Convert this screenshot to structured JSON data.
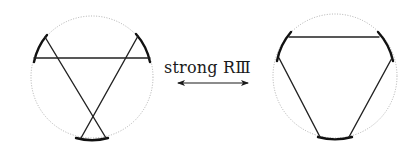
{
  "figure": {
    "move_label": "strong RⅢ",
    "arrow": "double-headed",
    "colors": {
      "background": "#ffffff",
      "boundary_circle": "#9a9a9a",
      "strands": "#222222",
      "arcs": "#111111"
    },
    "left_diagram": {
      "name": "before-move",
      "circle": {
        "cx": 92,
        "cy": 77,
        "r": 61
      },
      "arcs": [
        {
          "d": "M 34 62 A 61 61 0 0 1 47 35"
        },
        {
          "d": "M 136 34 A 61 61 0 0 1 150 62"
        },
        {
          "d": "M 76 138 A 61 61 0 0 0 108 138"
        }
      ],
      "strands": [
        {
          "x1": 34,
          "y1": 58,
          "x2": 150,
          "y2": 58
        },
        {
          "x1": 45,
          "y1": 37,
          "x2": 106,
          "y2": 138
        },
        {
          "x1": 138,
          "y1": 36,
          "x2": 81,
          "y2": 138
        }
      ]
    },
    "right_diagram": {
      "name": "after-move",
      "circle": {
        "cx": 335,
        "cy": 76,
        "r": 62
      },
      "arcs": [
        {
          "d": "M 277 61 A 62 62 0 0 1 291 32"
        },
        {
          "d": "M 378 32 A 62 62 0 0 1 393 61"
        },
        {
          "d": "M 318 137 A 62 62 0 0 0 352 137"
        }
      ],
      "strands": [
        {
          "x1": 289,
          "y1": 37,
          "x2": 379,
          "y2": 37
        },
        {
          "x1": 279,
          "y1": 58,
          "x2": 320,
          "y2": 137
        },
        {
          "x1": 392,
          "y1": 58,
          "x2": 349,
          "y2": 137
        }
      ]
    }
  }
}
